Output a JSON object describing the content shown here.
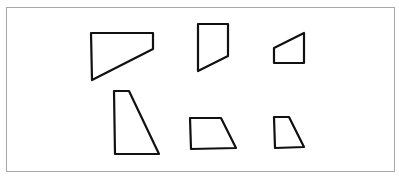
{
  "figure": {
    "frame_color": "#a8a8a8",
    "stroke_color": "#111111",
    "background": "#ffffff"
  },
  "shapes": [
    {
      "id": "shape-1",
      "row": 1,
      "col": 1,
      "points": "91,33 153,33 153,49 92,80"
    },
    {
      "id": "shape-2",
      "row": 1,
      "col": 2,
      "points": "198,24 228,24 228,56 198,71"
    },
    {
      "id": "shape-3",
      "row": 1,
      "col": 3,
      "points": "274,48 304,33 304,63 274,63"
    },
    {
      "id": "shape-4",
      "row": 2,
      "col": 1,
      "points": "114,91 129,91 159,154 115,154"
    },
    {
      "id": "shape-5",
      "row": 2,
      "col": 2,
      "points": "190,118 221,118 236,148 191,149"
    },
    {
      "id": "shape-6",
      "row": 2,
      "col": 3,
      "points": "274,117 289,117 304,147 275,148"
    }
  ]
}
